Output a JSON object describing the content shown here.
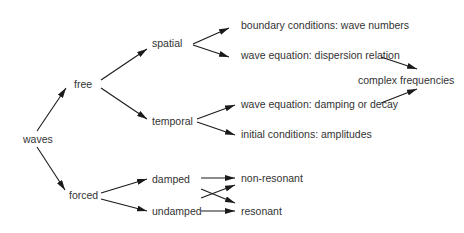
{
  "diagram": {
    "type": "tree-flow",
    "colors": {
      "text": "#333333",
      "arrow": "#1a1a1a",
      "background": "#ffffff"
    },
    "nodes": {
      "waves": {
        "label": "waves",
        "x": 23,
        "y": 139
      },
      "free": {
        "label": "free",
        "x": 74,
        "y": 84
      },
      "forced": {
        "label": "forced",
        "x": 69,
        "y": 195
      },
      "spatial": {
        "label": "spatial",
        "x": 152,
        "y": 43
      },
      "temporal": {
        "label": "temporal",
        "x": 152,
        "y": 121
      },
      "boundary": {
        "label": "boundary conditions: wave numbers",
        "x": 241,
        "y": 25
      },
      "dispersion": {
        "label": "wave equation: dispersion relation",
        "x": 241,
        "y": 55
      },
      "complex": {
        "label": "complex frequencies",
        "x": 358,
        "y": 80
      },
      "damping": {
        "label": "wave equation: damping or decay",
        "x": 241,
        "y": 104
      },
      "initial": {
        "label": "initial conditions: amplitudes",
        "x": 241,
        "y": 134
      },
      "damped": {
        "label": "damped",
        "x": 152,
        "y": 179
      },
      "undamped": {
        "label": "undamped",
        "x": 152,
        "y": 211
      },
      "nonresonant": {
        "label": "non-resonant",
        "x": 241,
        "y": 178
      },
      "resonant": {
        "label": "resonant",
        "x": 241,
        "y": 211
      }
    },
    "edges": [
      {
        "from": "waves",
        "to": "free",
        "x1": 37,
        "y1": 131,
        "x2": 66,
        "y2": 88
      },
      {
        "from": "waves",
        "to": "forced",
        "x1": 37,
        "y1": 147,
        "x2": 65,
        "y2": 190
      },
      {
        "from": "free",
        "to": "spatial",
        "x1": 101,
        "y1": 80,
        "x2": 147,
        "y2": 49
      },
      {
        "from": "free",
        "to": "temporal",
        "x1": 101,
        "y1": 88,
        "x2": 147,
        "y2": 119
      },
      {
        "from": "spatial",
        "to": "boundary",
        "x1": 193,
        "y1": 44,
        "x2": 229,
        "y2": 28
      },
      {
        "from": "spatial",
        "to": "dispersion",
        "x1": 193,
        "y1": 45,
        "x2": 229,
        "y2": 57
      },
      {
        "from": "temporal",
        "to": "damping",
        "x1": 197,
        "y1": 119,
        "x2": 235,
        "y2": 105
      },
      {
        "from": "temporal",
        "to": "initial",
        "x1": 197,
        "y1": 122,
        "x2": 235,
        "y2": 135
      },
      {
        "from": "dispersion",
        "to": "complex",
        "x1": 381,
        "y1": 57,
        "x2": 417,
        "y2": 69
      },
      {
        "from": "damping",
        "to": "complex",
        "x1": 381,
        "y1": 103,
        "x2": 417,
        "y2": 89
      },
      {
        "from": "forced",
        "to": "damped",
        "x1": 101,
        "y1": 193,
        "x2": 147,
        "y2": 179
      },
      {
        "from": "forced",
        "to": "undamped",
        "x1": 101,
        "y1": 199,
        "x2": 147,
        "y2": 211
      },
      {
        "from": "damped",
        "to": "nonresonant",
        "x1": 201,
        "y1": 178,
        "x2": 235,
        "y2": 178
      },
      {
        "from": "undamped",
        "to": "resonant",
        "x1": 201,
        "y1": 211,
        "x2": 235,
        "y2": 211
      },
      {
        "from": "undamped",
        "to": "nonresonant",
        "x1": 201,
        "y1": 198,
        "x2": 235,
        "y2": 185
      },
      {
        "from": "damped",
        "to": "resonant",
        "x1": 201,
        "y1": 189,
        "x2": 235,
        "y2": 203
      }
    ]
  }
}
